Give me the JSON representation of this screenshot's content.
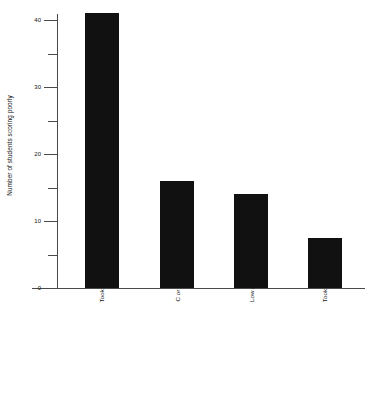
{
  "chart_data": {
    "type": "bar",
    "title": "",
    "subtitle": "",
    "xlabel": "",
    "ylabel": "Number of students scoring poorly",
    "categories": [
      "Took test four months or more after AP",
      "C or below in AP courses",
      "Low ACT/SAT",
      "Took AP elsewhere"
    ],
    "values": [
      41,
      16,
      14,
      7.5
    ],
    "ylim": [
      0,
      41
    ],
    "y_major_ticks": [
      0,
      10,
      20,
      30,
      40
    ],
    "y_minor_ticks": [
      5,
      15,
      25,
      35
    ],
    "y_tick_labels": [
      "0",
      "10",
      "20",
      "30",
      "40"
    ],
    "grid": false,
    "legend": null,
    "legend_position": "none",
    "bar_color": "#111111",
    "axis_color": "#4a4a4a",
    "background_color": "#ffffff"
  }
}
